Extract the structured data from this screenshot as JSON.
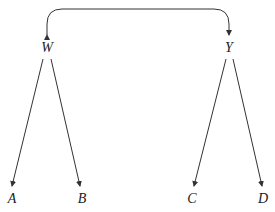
{
  "nodes": {
    "W": {
      "label": "W"
    },
    "Y": {
      "label": "Y"
    },
    "A": {
      "label": "A"
    },
    "B": {
      "label": "B"
    },
    "C": {
      "label": "C"
    },
    "D": {
      "label": "D"
    }
  },
  "edges": [
    {
      "from": "W",
      "to": "A"
    },
    {
      "from": "W",
      "to": "B"
    },
    {
      "from": "Y",
      "to": "C"
    },
    {
      "from": "Y",
      "to": "D"
    },
    {
      "from": "W",
      "to": "Y",
      "bidirectional": true
    }
  ],
  "colors": {
    "line": "#333333",
    "background": "#ffffff"
  }
}
